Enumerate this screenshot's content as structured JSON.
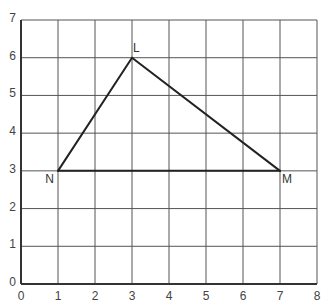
{
  "chart_data": {
    "type": "scatter",
    "title": "",
    "xlabel": "",
    "ylabel": "",
    "xlim": [
      0,
      8
    ],
    "ylim": [
      0,
      7
    ],
    "grid": true,
    "x_ticks": [
      "0",
      "1",
      "2",
      "3",
      "4",
      "5",
      "6",
      "7",
      "8"
    ],
    "y_ticks": [
      "0",
      "1",
      "2",
      "3",
      "4",
      "5",
      "6",
      "7"
    ],
    "shape": "triangle",
    "points": [
      {
        "label": "L",
        "x": 3,
        "y": 6
      },
      {
        "label": "M",
        "x": 7,
        "y": 3
      },
      {
        "label": "N",
        "x": 1,
        "y": 3
      }
    ],
    "segments": [
      [
        "N",
        "L"
      ],
      [
        "L",
        "M"
      ],
      [
        "M",
        "N"
      ]
    ],
    "colors": {
      "grid": "#555555",
      "axis": "#333333",
      "triangle": "#222222",
      "text": "#444444"
    }
  }
}
